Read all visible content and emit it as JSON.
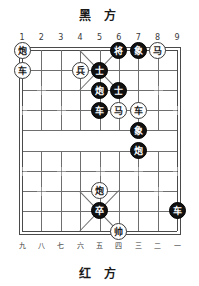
{
  "header": {
    "top_title": "黑 方",
    "bottom_title": "红 方"
  },
  "files": {
    "top": [
      "1",
      "2",
      "3",
      "4",
      "5",
      "6",
      "7",
      "8",
      "9"
    ],
    "bottom": [
      "九",
      "八",
      "七",
      "六",
      "五",
      "四",
      "三",
      "二",
      "一"
    ]
  },
  "board": {
    "columns": 9,
    "rows": 10,
    "river_between_rows": [
      4,
      5
    ]
  },
  "pieces": [
    {
      "name": "cannon",
      "char": "炮",
      "side": "red",
      "col": 1,
      "row": 0
    },
    {
      "name": "general",
      "char": "将",
      "side": "black",
      "col": 6,
      "row": 0
    },
    {
      "name": "elephant",
      "char": "象",
      "side": "black",
      "col": 7,
      "row": 0
    },
    {
      "name": "horse",
      "char": "马",
      "side": "red",
      "col": 8,
      "row": 0
    },
    {
      "name": "chariot",
      "char": "车",
      "side": "red",
      "col": 1,
      "row": 1
    },
    {
      "name": "pawn",
      "char": "兵",
      "side": "red",
      "col": 4,
      "row": 1
    },
    {
      "name": "advisor",
      "char": "士",
      "side": "black",
      "col": 5,
      "row": 1
    },
    {
      "name": "cannon",
      "char": "炮",
      "side": "black",
      "col": 5,
      "row": 2
    },
    {
      "name": "advisor",
      "char": "士",
      "side": "black",
      "col": 6,
      "row": 2
    },
    {
      "name": "chariot",
      "char": "车",
      "side": "black",
      "col": 5,
      "row": 3
    },
    {
      "name": "horse",
      "char": "马",
      "side": "red",
      "col": 6,
      "row": 3
    },
    {
      "name": "chariot",
      "char": "车",
      "side": "red",
      "col": 7,
      "row": 3
    },
    {
      "name": "elephant",
      "char": "象",
      "side": "black",
      "col": 7,
      "row": 4
    },
    {
      "name": "cannon",
      "char": "炮",
      "side": "black",
      "col": 7,
      "row": 5
    },
    {
      "name": "cannon",
      "char": "炮",
      "side": "red",
      "col": 5,
      "row": 7
    },
    {
      "name": "pawn",
      "char": "卒",
      "side": "black",
      "col": 5,
      "row": 8
    },
    {
      "name": "chariot",
      "char": "车",
      "side": "black",
      "col": 9,
      "row": 8
    },
    {
      "name": "marshal",
      "char": "帅",
      "side": "red",
      "col": 6,
      "row": 9
    }
  ],
  "colors": {
    "black_piece_bg": "#111111",
    "black_piece_fg": "#ffffff",
    "red_piece_bg": "#ffffff",
    "red_piece_fg": "#1a1a1a",
    "grid_line": "#6e6e6e",
    "border_line": "#4a4a4a",
    "star_mark": "#9a9a9a",
    "label_text": "#3a3a3a",
    "title_text": "#1a1a1a",
    "page_bg": "#ffffff"
  }
}
